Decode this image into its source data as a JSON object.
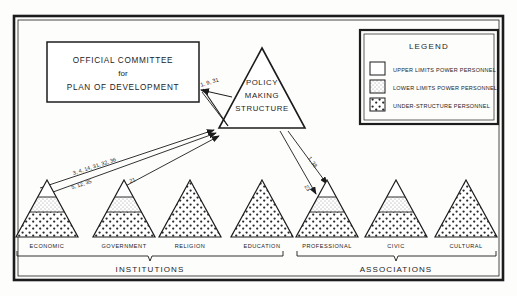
{
  "figure": {
    "title_hidden": "",
    "background_color": "#fdfdfc",
    "ink_color": "#1c1c1c"
  },
  "official_box": {
    "line1": "OFFICIAL COMMITTEE",
    "line2": "for",
    "line3": "PLAN OF DEVELOPMENT"
  },
  "policy_triangle": {
    "line1": "POLICY",
    "line2": "MAKING",
    "line3": "STRUCTURE"
  },
  "legend": {
    "title": "LEGEND",
    "items": [
      {
        "label": "UPPER LIMITS POWER PERSONNEL",
        "swatch": "white-swatch"
      },
      {
        "label": "LOWER LIMITS POWER PERSONNEL",
        "swatch": "light-stipple-swatch"
      },
      {
        "label": "UNDER-STRUCTURE PERSONNEL",
        "swatch": "dense-stipple-swatch"
      }
    ]
  },
  "arrow_labels": {
    "to_official_committee": "1, 9, 31",
    "economic_upper": "3, 4, 14, 31, 32, 36",
    "economic_lower": "5, 12, 35",
    "government": "21",
    "professional_upper": "1, 38",
    "professional_lower": "23"
  },
  "triangles": [
    {
      "label": "ECONOMIC",
      "banded": true,
      "group": "institutions"
    },
    {
      "label": "GOVERNMENT",
      "banded": true,
      "group": "institutions"
    },
    {
      "label": "RELIGION",
      "banded": false,
      "group": "institutions"
    },
    {
      "label": "EDUCATION",
      "banded": false,
      "group": "institutions"
    },
    {
      "label": "PROFESSIONAL",
      "banded": true,
      "group": "associations"
    },
    {
      "label": "CIVIC",
      "banded": true,
      "group": "associations"
    },
    {
      "label": "CULTURAL",
      "banded": false,
      "group": "associations"
    }
  ],
  "groups": {
    "institutions": "INSTITUTIONS",
    "associations": "ASSOCIATIONS"
  }
}
